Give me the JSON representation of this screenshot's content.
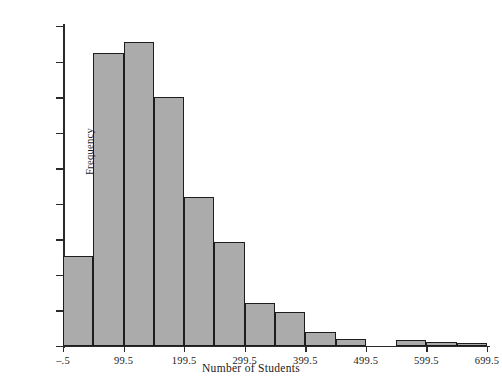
{
  "chart_data": {
    "type": "bar",
    "title": "",
    "xlabel": "Number of Students",
    "ylabel": "Frequency",
    "ylim": [
      0,
      225
    ],
    "xlim": [
      -0.5,
      699.5
    ],
    "grid": false,
    "legend": null,
    "ytick_labels": [
      "0",
      "25",
      "50",
      "75",
      "100",
      "125",
      "150",
      "175",
      "200",
      "225"
    ],
    "ytick_values": [
      0,
      25,
      50,
      75,
      100,
      125,
      150,
      175,
      200,
      225
    ],
    "xtick_labels": [
      "–.5",
      "99.5",
      "199.5",
      "299.5",
      "399.5",
      "499.5",
      "599.5",
      "699.5"
    ],
    "xtick_values": [
      -0.5,
      99.5,
      199.5,
      299.5,
      399.5,
      499.5,
      599.5,
      699.5
    ],
    "bin_width": 50,
    "bin_edges": [
      -0.5,
      49.5,
      99.5,
      149.5,
      199.5,
      249.5,
      299.5,
      349.5,
      399.5,
      449.5,
      499.5,
      549.5,
      599.5,
      649.5,
      699.5
    ],
    "categories": [
      "-.5 to 49.5",
      "49.5 to 99.5",
      "99.5 to 149.5",
      "149.5 to 199.5",
      "199.5 to 249.5",
      "249.5 to 299.5",
      "299.5 to 349.5",
      "349.5 to 399.5",
      "399.5 to 449.5",
      "449.5 to 499.5",
      "499.5 to 549.5",
      "549.5 to 599.5",
      "599.5 to 649.5",
      "649.5 to 699.5"
    ],
    "values": [
      63,
      206,
      214,
      175,
      105,
      73,
      30,
      24,
      10,
      5,
      0,
      4,
      3,
      2
    ],
    "bar_fill_color": "#ababab",
    "bar_edge_color": "#1d1d1d",
    "axis_color": "#2a2a2a"
  }
}
